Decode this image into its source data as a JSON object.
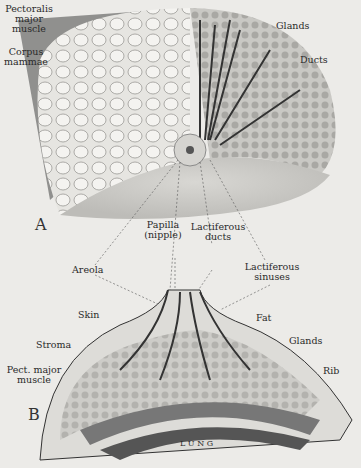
{
  "figure": {
    "panel_a": {
      "letter": "A",
      "labels": {
        "pectoralis": "Pectoralis\nmajor\nmuscle",
        "corpus": "Corpus\nmammae",
        "glands": "Glands",
        "ducts": "Ducts",
        "papilla": "Papilla\n(nipple)",
        "lactiferous_ducts": "Lactiferous\nducts"
      }
    },
    "panel_b": {
      "letter": "B",
      "labels": {
        "areola": "Areola",
        "lactiferous_sinuses": "Lactiferous\nsinuses",
        "skin": "Skin",
        "fat": "Fat",
        "stroma": "Stroma",
        "glands": "Glands",
        "pect_major": "Pect. major\nmuscle",
        "rib": "Rib",
        "lung": "L U N G"
      }
    }
  }
}
